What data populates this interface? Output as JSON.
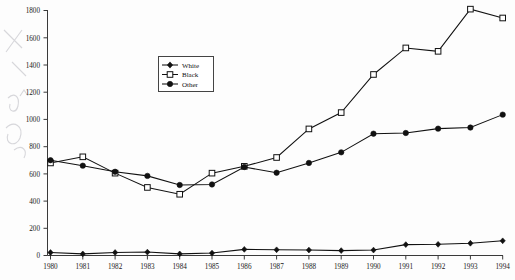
{
  "chart_data": {
    "type": "line",
    "title": "",
    "xlabel": "",
    "ylabel": "",
    "x": [
      1980,
      1981,
      1982,
      1983,
      1984,
      1985,
      1986,
      1987,
      1988,
      1989,
      1990,
      1991,
      1992,
      1993,
      1994
    ],
    "xtick_labels": [
      "1980",
      "1981",
      "1982",
      "1983",
      "1984",
      "1985",
      "1986",
      "1987",
      "1988",
      "1989",
      "1990",
      "1991",
      "1992",
      "1993",
      "1994"
    ],
    "ytick_labels": [
      "0",
      "200",
      "400",
      "600",
      "800",
      "1000",
      "1200",
      "1400",
      "1600",
      "1800"
    ],
    "ytick_values": [
      0,
      200,
      400,
      600,
      800,
      1000,
      1200,
      1400,
      1600,
      1800
    ],
    "ylim": [
      0,
      1800
    ],
    "xlim": [
      1980,
      1994
    ],
    "grid": false,
    "legend_position": "upper-center-left",
    "series": [
      {
        "name": "White",
        "marker": "filled-diamond",
        "color": "#111111",
        "values": [
          22,
          12,
          22,
          25,
          12,
          18,
          45,
          42,
          40,
          36,
          40,
          80,
          82,
          90,
          108
        ]
      },
      {
        "name": "Black",
        "marker": "open-square",
        "color": "#111111",
        "values": [
          680,
          725,
          605,
          500,
          450,
          605,
          655,
          720,
          930,
          1050,
          1330,
          1525,
          1500,
          1810,
          1745
        ]
      },
      {
        "name": "Other",
        "marker": "filled-circle",
        "color": "#111111",
        "values": [
          700,
          660,
          615,
          585,
          518,
          522,
          650,
          608,
          680,
          758,
          895,
          900,
          932,
          940,
          1035
        ]
      }
    ]
  },
  "legend": {
    "entries": [
      {
        "label": "White"
      },
      {
        "label": "Black"
      },
      {
        "label": "Other"
      }
    ]
  },
  "annotations": {
    "margin_marks": "handwritten-pencil-marks"
  }
}
